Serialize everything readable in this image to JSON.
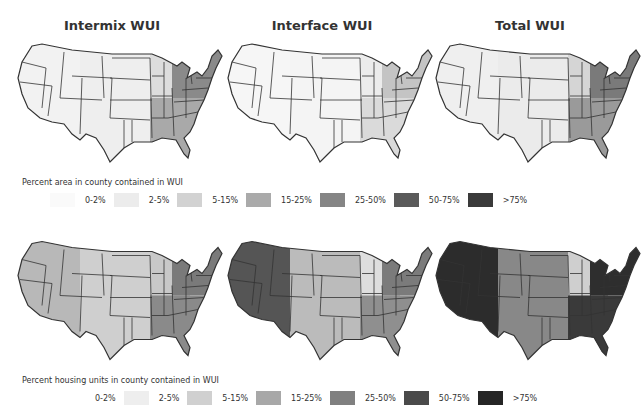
{
  "columns": [
    {
      "title": "Intermix WUI"
    },
    {
      "title": "Interface WUI"
    },
    {
      "title": "Total WUI"
    }
  ],
  "legend_area": {
    "caption": "Percent area in county contained in WUI",
    "items": [
      {
        "label": "0-2%",
        "color": "#fafafa"
      },
      {
        "label": "2-5%",
        "color": "#ececec"
      },
      {
        "label": "5-15%",
        "color": "#d2d2d2"
      },
      {
        "label": "15-25%",
        "color": "#aaaaaa"
      },
      {
        "label": "25-50%",
        "color": "#858585"
      },
      {
        "label": "50-75%",
        "color": "#5a5a5a"
      },
      {
        "label": ">75%",
        "color": "#3a3a3a"
      }
    ]
  },
  "legend_housing": {
    "caption": "Percent housing units in county contained in WUI",
    "items": [
      {
        "label": "0-2%",
        "color": "#ffffff"
      },
      {
        "label": "2-5%",
        "color": "#eeeeee"
      },
      {
        "label": "5-15%",
        "color": "#d0d0d0"
      },
      {
        "label": "15-25%",
        "color": "#a8a8a8"
      },
      {
        "label": "25-50%",
        "color": "#808080"
      },
      {
        "label": "50-75%",
        "color": "#4a4a4a"
      },
      {
        "label": ">75%",
        "color": "#252525"
      }
    ]
  },
  "maps": {
    "row1": [
      {
        "name": "Intermix WUI - percent area",
        "west": "#f2f2f2",
        "plains": "#eeeeee",
        "midwest": "#dddddd",
        "southeast": "#a9a9a9",
        "northeast": "#8a8a8a"
      },
      {
        "name": "Interface WUI - percent area",
        "west": "#f6f6f6",
        "plains": "#f4f4f4",
        "midwest": "#ececec",
        "southeast": "#dadada",
        "northeast": "#c4c4c4"
      },
      {
        "name": "Total WUI - percent area",
        "west": "#efefef",
        "plains": "#ebebeb",
        "midwest": "#d5d5d5",
        "southeast": "#9a9a9a",
        "northeast": "#7a7a7a"
      }
    ],
    "row2": [
      {
        "name": "Intermix WUI - percent housing",
        "west": "#b8b8b8",
        "plains": "#cfcfcf",
        "midwest": "#c8c8c8",
        "southeast": "#8a8a8a",
        "northeast": "#7a7a7a"
      },
      {
        "name": "Interface WUI - percent housing",
        "west": "#555555",
        "plains": "#bbbbbb",
        "midwest": "#dedede",
        "southeast": "#8f8f8f",
        "northeast": "#7b7b7b"
      },
      {
        "name": "Total WUI - percent housing",
        "west": "#2c2c2c",
        "plains": "#888888",
        "midwest": "#cfcfcf",
        "southeast": "#3a3a3a",
        "northeast": "#2e2e2e"
      }
    ]
  }
}
